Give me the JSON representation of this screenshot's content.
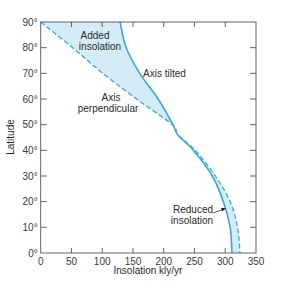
{
  "chart_data": {
    "type": "line",
    "title": "",
    "xlabel": "Insolation kly/yr",
    "ylabel": "Latitude",
    "xlim": [
      0,
      350
    ],
    "ylim": [
      0,
      90
    ],
    "xticks": [
      0,
      50,
      100,
      150,
      200,
      250,
      300,
      350
    ],
    "xtick_labels": [
      "0",
      "50",
      "100",
      "150",
      "200",
      "250",
      "300",
      "350"
    ],
    "yticks": [
      0,
      10,
      20,
      30,
      40,
      50,
      60,
      70,
      80,
      90
    ],
    "ytick_labels": [
      "0°",
      "10°",
      "20°",
      "30°",
      "40°",
      "50°",
      "60°",
      "70°",
      "80°",
      "90°"
    ],
    "grid": false,
    "series": [
      {
        "name": "Axis tilted",
        "style": "solid",
        "color": "#3aa8d8",
        "latitude": [
          90,
          80,
          70,
          60,
          50,
          46,
          40,
          30,
          20,
          10,
          0
        ],
        "insolation": [
          129,
          139,
          161,
          191,
          215,
          223,
          248,
          279,
          297,
          308,
          311
        ]
      },
      {
        "name": "Axis perpendicular",
        "style": "dashed",
        "color": "#3aa8d8",
        "latitude": [
          90,
          80,
          70,
          60,
          50,
          46,
          40,
          30,
          20,
          10,
          0
        ],
        "insolation": [
          0,
          52,
          101,
          156,
          214,
          223,
          251,
          284,
          308,
          320,
          324
        ]
      }
    ],
    "annotations": [
      {
        "text_lines": [
          "Added",
          "insolation"
        ],
        "region": "between curves above ~46°"
      },
      {
        "text_lines": [
          "Axis tilted"
        ],
        "target": "solid curve"
      },
      {
        "text_lines": [
          "Axis",
          "perpendicular"
        ],
        "target": "dashed curve"
      },
      {
        "text_lines": [
          "Reduced",
          "insolation"
        ],
        "region": "between curves below ~46°",
        "arrow": true
      }
    ],
    "fill_color": "#d4ecf5"
  },
  "labels": {
    "xlabel": "Insolation kly/yr",
    "ylabel": "Latitude",
    "added_1": "Added",
    "added_2": "insolation",
    "tilted": "Axis tilted",
    "perp_1": "Axis",
    "perp_2": "perpendicular",
    "reduced_1": "Reduced",
    "reduced_2": "insolation"
  }
}
